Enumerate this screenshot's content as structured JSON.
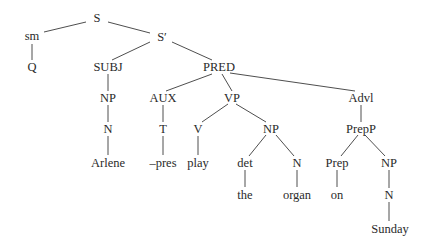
{
  "diagram": {
    "type": "syntax-tree",
    "nodes": [
      {
        "id": "S",
        "label": "S",
        "x": 97,
        "y": 18
      },
      {
        "id": "sm",
        "label": "sm",
        "x": 32,
        "y": 36
      },
      {
        "id": "Q",
        "label": "Q",
        "x": 32,
        "y": 67
      },
      {
        "id": "S1",
        "label": "S′",
        "x": 162,
        "y": 37
      },
      {
        "id": "SUBJ",
        "label": "SUBJ",
        "x": 108,
        "y": 67
      },
      {
        "id": "PRED",
        "label": "PRED",
        "x": 219,
        "y": 67
      },
      {
        "id": "NP1",
        "label": "NP",
        "x": 108,
        "y": 98
      },
      {
        "id": "N1",
        "label": "N",
        "x": 108,
        "y": 129
      },
      {
        "id": "Arlene",
        "label": "Arlene",
        "x": 108,
        "y": 163
      },
      {
        "id": "AUX",
        "label": "AUX",
        "x": 163,
        "y": 98
      },
      {
        "id": "T",
        "label": "T",
        "x": 163,
        "y": 129
      },
      {
        "id": "pres",
        "label": "–pres",
        "x": 163,
        "y": 163
      },
      {
        "id": "VP",
        "label": "VP",
        "x": 232,
        "y": 98
      },
      {
        "id": "V",
        "label": "V",
        "x": 198,
        "y": 129
      },
      {
        "id": "play",
        "label": "play",
        "x": 198,
        "y": 163
      },
      {
        "id": "NP2",
        "label": "NP",
        "x": 271,
        "y": 129
      },
      {
        "id": "det",
        "label": "det",
        "x": 245,
        "y": 163
      },
      {
        "id": "the",
        "label": "the",
        "x": 245,
        "y": 195
      },
      {
        "id": "N2",
        "label": "N",
        "x": 297,
        "y": 163
      },
      {
        "id": "organ",
        "label": "organ",
        "x": 297,
        "y": 195
      },
      {
        "id": "Advl",
        "label": "Advl",
        "x": 361,
        "y": 98
      },
      {
        "id": "PrepP",
        "label": "PrepP",
        "x": 361,
        "y": 129
      },
      {
        "id": "Prep",
        "label": "Prep",
        "x": 337,
        "y": 163
      },
      {
        "id": "on",
        "label": "on",
        "x": 337,
        "y": 195
      },
      {
        "id": "NP3",
        "label": "NP",
        "x": 389,
        "y": 163
      },
      {
        "id": "N3",
        "label": "N",
        "x": 389,
        "y": 195
      },
      {
        "id": "Sunday",
        "label": "Sunday",
        "x": 390,
        "y": 229
      }
    ],
    "edges": [
      {
        "from": [
          86,
          22
        ],
        "to": [
          44,
          32
        ]
      },
      {
        "from": [
          108,
          22
        ],
        "to": [
          150,
          33
        ]
      },
      {
        "from": [
          32,
          44
        ],
        "to": [
          32,
          60
        ]
      },
      {
        "from": [
          150,
          42
        ],
        "to": [
          112,
          60
        ]
      },
      {
        "from": [
          172,
          42
        ],
        "to": [
          212,
          60
        ]
      },
      {
        "from": [
          108,
          74
        ],
        "to": [
          108,
          91
        ]
      },
      {
        "from": [
          108,
          105
        ],
        "to": [
          108,
          122
        ]
      },
      {
        "from": [
          108,
          136
        ],
        "to": [
          108,
          155
        ]
      },
      {
        "from": [
          212,
          74
        ],
        "to": [
          166,
          91
        ]
      },
      {
        "from": [
          222,
          74
        ],
        "to": [
          232,
          91
        ]
      },
      {
        "from": [
          230,
          73
        ],
        "to": [
          355,
          91
        ]
      },
      {
        "from": [
          163,
          105
        ],
        "to": [
          163,
          122
        ]
      },
      {
        "from": [
          163,
          136
        ],
        "to": [
          163,
          155
        ]
      },
      {
        "from": [
          228,
          104
        ],
        "to": [
          202,
          122
        ]
      },
      {
        "from": [
          236,
          104
        ],
        "to": [
          266,
          122
        ]
      },
      {
        "from": [
          198,
          136
        ],
        "to": [
          198,
          155
        ]
      },
      {
        "from": [
          266,
          135
        ],
        "to": [
          249,
          156
        ]
      },
      {
        "from": [
          276,
          135
        ],
        "to": [
          294,
          156
        ]
      },
      {
        "from": [
          245,
          170
        ],
        "to": [
          245,
          187
        ]
      },
      {
        "from": [
          297,
          170
        ],
        "to": [
          297,
          187
        ]
      },
      {
        "from": [
          361,
          105
        ],
        "to": [
          361,
          122
        ]
      },
      {
        "from": [
          358,
          135
        ],
        "to": [
          341,
          156
        ]
      },
      {
        "from": [
          365,
          135
        ],
        "to": [
          385,
          156
        ]
      },
      {
        "from": [
          337,
          170
        ],
        "to": [
          337,
          187
        ]
      },
      {
        "from": [
          389,
          170
        ],
        "to": [
          389,
          188
        ]
      },
      {
        "from": [
          389,
          202
        ],
        "to": [
          389,
          221
        ]
      }
    ]
  }
}
